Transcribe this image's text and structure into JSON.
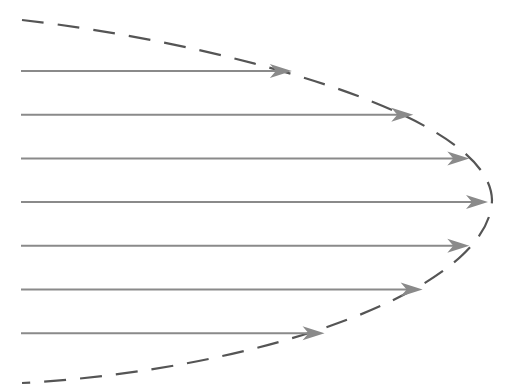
{
  "diagram": {
    "arrows": [
      {
        "name": "arrow-1",
        "relative_velocity": 0.58
      },
      {
        "name": "arrow-2",
        "relative_velocity": 0.84
      },
      {
        "name": "arrow-3",
        "relative_velocity": 0.96
      },
      {
        "name": "arrow-4",
        "relative_velocity": 1.0
      },
      {
        "name": "arrow-5",
        "relative_velocity": 0.96
      },
      {
        "name": "arrow-6",
        "relative_velocity": 0.86
      },
      {
        "name": "arrow-7",
        "relative_velocity": 0.65
      }
    ],
    "envelope": {
      "style": "dashed",
      "shape": "parabola"
    },
    "colors": {
      "arrow": "#8a8a8a",
      "envelope": "#555555",
      "background": "#ffffff"
    }
  }
}
